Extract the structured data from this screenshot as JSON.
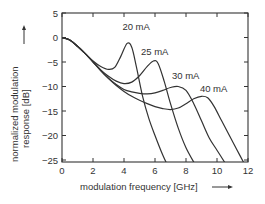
{
  "chart_data": {
    "type": "line",
    "title": "",
    "xlabel": "modulation frequency [GHz]",
    "ylabel_line1": "normalized modulation",
    "ylabel_line2": "response [dB]",
    "xlim": [
      0,
      12
    ],
    "ylim": [
      -26,
      5
    ],
    "x_ticks": [
      0,
      2,
      4,
      6,
      8,
      10,
      12
    ],
    "y_ticks": [
      5,
      0,
      -5,
      -10,
      -15,
      -20,
      -25
    ],
    "x_tick_labels": [
      "0",
      "2",
      "4",
      "6",
      "8",
      "10",
      "12"
    ],
    "y_tick_labels": [
      "5",
      "0",
      "−5",
      "−10",
      "−15",
      "−20",
      "−25"
    ],
    "grid": false,
    "legend": "inline labels",
    "series": [
      {
        "name": "20 mA",
        "label_pos": [
          4.8,
          2.2
        ],
        "points": [
          [
            0,
            0
          ],
          [
            0.5,
            -0.5
          ],
          [
            1,
            -1.8
          ],
          [
            1.5,
            -3.3
          ],
          [
            2,
            -4.8
          ],
          [
            2.5,
            -5.9
          ],
          [
            3,
            -6.5
          ],
          [
            3.4,
            -6.1
          ],
          [
            3.8,
            -3.8
          ],
          [
            4.2,
            -1.2
          ],
          [
            4.5,
            -2.0
          ],
          [
            4.8,
            -6
          ],
          [
            5.2,
            -12
          ],
          [
            5.6,
            -16.5
          ],
          [
            6,
            -20
          ],
          [
            6.5,
            -24
          ],
          [
            6.8,
            -26
          ]
        ]
      },
      {
        "name": "25 mA",
        "label_pos": [
          6.0,
          -2.9
        ],
        "points": [
          [
            0,
            0
          ],
          [
            0.5,
            -0.5
          ],
          [
            1,
            -1.8
          ],
          [
            1.5,
            -3.3
          ],
          [
            2,
            -4.9
          ],
          [
            2.5,
            -6.6
          ],
          [
            3,
            -7.9
          ],
          [
            3.5,
            -8.9
          ],
          [
            4,
            -9.4
          ],
          [
            4.5,
            -9.1
          ],
          [
            5,
            -7.8
          ],
          [
            5.5,
            -5.9
          ],
          [
            5.9,
            -4.8
          ],
          [
            6.2,
            -5.3
          ],
          [
            6.6,
            -9
          ],
          [
            7,
            -13.5
          ],
          [
            7.5,
            -18.5
          ],
          [
            8,
            -22.5
          ],
          [
            8.6,
            -26
          ]
        ]
      },
      {
        "name": "30 mA",
        "label_pos": [
          8.0,
          -7.9
        ],
        "points": [
          [
            0,
            0
          ],
          [
            0.5,
            -0.5
          ],
          [
            1,
            -1.8
          ],
          [
            1.5,
            -3.3
          ],
          [
            2,
            -5.0
          ],
          [
            2.5,
            -6.7
          ],
          [
            3,
            -8.3
          ],
          [
            3.5,
            -9.6
          ],
          [
            4,
            -10.6
          ],
          [
            4.5,
            -11.1
          ],
          [
            5,
            -11.4
          ],
          [
            5.5,
            -11.5
          ],
          [
            6,
            -11.3
          ],
          [
            6.5,
            -10.8
          ],
          [
            7,
            -10.2
          ],
          [
            7.5,
            -10.0
          ],
          [
            8,
            -10.8
          ],
          [
            8.5,
            -13.5
          ],
          [
            9,
            -17
          ],
          [
            9.5,
            -20.5
          ],
          [
            10,
            -23
          ],
          [
            10.6,
            -26
          ]
        ]
      },
      {
        "name": "40 mA",
        "label_pos": [
          9.8,
          -10.6
        ],
        "points": [
          [
            0,
            0
          ],
          [
            0.5,
            -0.5
          ],
          [
            1,
            -1.8
          ],
          [
            1.5,
            -3.3
          ],
          [
            2,
            -5.0
          ],
          [
            2.5,
            -6.8
          ],
          [
            3,
            -8.4
          ],
          [
            3.5,
            -9.8
          ],
          [
            4,
            -11.0
          ],
          [
            4.5,
            -12.0
          ],
          [
            5,
            -12.8
          ],
          [
            5.5,
            -13.5
          ],
          [
            6,
            -14.1
          ],
          [
            6.5,
            -14.5
          ],
          [
            7,
            -14.7
          ],
          [
            7.5,
            -14.4
          ],
          [
            8,
            -13.5
          ],
          [
            8.5,
            -12.5
          ],
          [
            9,
            -12.0
          ],
          [
            9.4,
            -12.3
          ],
          [
            9.8,
            -14
          ],
          [
            10.3,
            -17
          ],
          [
            10.8,
            -20
          ],
          [
            11.3,
            -23
          ],
          [
            11.8,
            -26
          ]
        ]
      }
    ]
  }
}
